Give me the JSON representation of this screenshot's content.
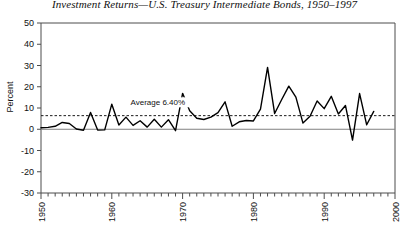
{
  "chart_data": {
    "type": "line",
    "title": "Investment Returns—U.S. Treasury Intermediate Bonds, 1950–1997",
    "xlabel": "",
    "ylabel": "Percent",
    "ylim": [
      -30,
      50
    ],
    "xlim": [
      1950,
      2000
    ],
    "ytick_labels": [
      "50",
      "40",
      "30",
      "20",
      "10",
      "0",
      "-10",
      "-20",
      "-30"
    ],
    "ytick_values": [
      50,
      40,
      30,
      20,
      10,
      0,
      -10,
      -20,
      -30
    ],
    "xtick_labels": [
      "1950",
      "1960",
      "1970",
      "1980",
      "1990",
      "2000"
    ],
    "xtick_values": [
      1950,
      1960,
      1970,
      1980,
      1990,
      2000
    ],
    "minor_xticks": true,
    "grid": false,
    "legend": false,
    "annotations": [
      {
        "name": "average-line-label",
        "text": "Average 6.40%",
        "x": 1966.5,
        "y": 11.5
      }
    ],
    "reference_lines": [
      {
        "name": "average-line",
        "value": 6.4,
        "style": "dashed"
      },
      {
        "name": "zero-line",
        "value": 0,
        "style": "solid"
      }
    ],
    "x": [
      1950,
      1951,
      1952,
      1953,
      1954,
      1955,
      1956,
      1957,
      1958,
      1959,
      1960,
      1961,
      1962,
      1963,
      1964,
      1965,
      1966,
      1967,
      1968,
      1969,
      1970,
      1971,
      1972,
      1973,
      1974,
      1975,
      1976,
      1977,
      1978,
      1979,
      1980,
      1981,
      1982,
      1983,
      1984,
      1985,
      1986,
      1987,
      1988,
      1989,
      1990,
      1991,
      1992,
      1993,
      1994,
      1995,
      1996,
      1997
    ],
    "values": [
      0.7,
      0.9,
      1.4,
      3.2,
      2.7,
      0.1,
      -0.5,
      7.9,
      -0.4,
      -0.3,
      11.8,
      2.0,
      5.7,
      1.8,
      4.0,
      1.0,
      4.7,
      1.0,
      4.5,
      -0.7,
      16.9,
      8.7,
      5.2,
      4.6,
      5.7,
      7.8,
      12.9,
      1.4,
      3.5,
      4.1,
      3.9,
      9.5,
      29.1,
      7.4,
      14.0,
      20.3,
      15.1,
      2.9,
      6.1,
      13.3,
      9.7,
      15.5,
      7.2,
      11.2,
      -5.1,
      16.8,
      2.1,
      8.4
    ],
    "series_color": "#000000",
    "average": 6.4
  }
}
